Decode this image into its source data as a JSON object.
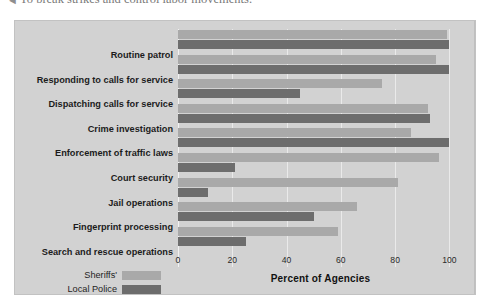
{
  "caption": {
    "bullet": "◄",
    "text": "To break strikes and control labor movements."
  },
  "colors": {
    "sheriffs": "#a9a9a9",
    "local_police": "#6d6d6d",
    "figure_background": "#d2d2d2",
    "gridline": "#eaeaea",
    "page_background": "#ffffff"
  },
  "legend": {
    "items": [
      {
        "label": "Sheriffs'",
        "color": "#a9a9a9"
      },
      {
        "label": "Local Police",
        "color": "#6d6d6d"
      }
    ]
  },
  "chart_data": {
    "type": "bar",
    "orientation": "horizontal",
    "title": "",
    "xlabel": "Percent of Agencies",
    "ylabel": "",
    "xlim": [
      0,
      105
    ],
    "xticks": [
      0,
      20,
      40,
      60,
      80,
      100
    ],
    "xtick_labels": [
      "0",
      "20",
      "40",
      "60",
      "80",
      "100"
    ],
    "grid": true,
    "legend_position": "bottom-left",
    "categories": [
      "Routine patrol",
      "Responding to calls for service",
      "Dispatching calls for service",
      "Crime investigation",
      "Enforcement of traffic laws",
      "Court security",
      "Jail operations",
      "Fingerprint processing",
      "Search and rescue operations"
    ],
    "series": [
      {
        "name": "Sheriffs'",
        "color": "#a9a9a9",
        "values": [
          99,
          95,
          75,
          92,
          86,
          96,
          81,
          66,
          59
        ]
      },
      {
        "name": "Local Police",
        "color": "#6d6d6d",
        "values": [
          100,
          100,
          45,
          93,
          100,
          21,
          11,
          50,
          25
        ]
      }
    ]
  }
}
